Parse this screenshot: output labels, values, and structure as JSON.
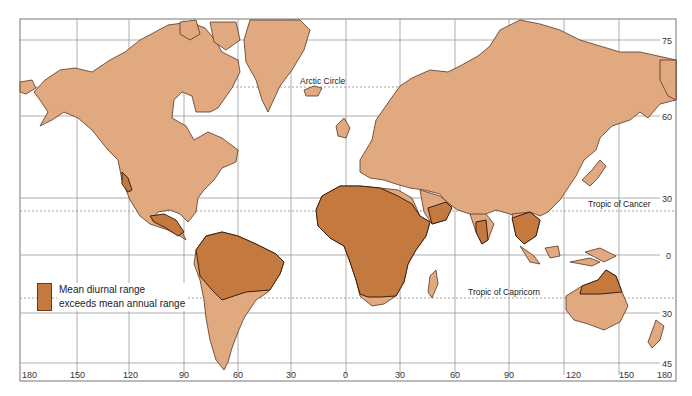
{
  "map": {
    "type": "world-mercator",
    "colors": {
      "land": "#e0a97f",
      "land_arid_region": "#d4a183",
      "highlight_region": "#c47a3e",
      "coastline": "#5a3520",
      "highlight_border": "#3a1f10",
      "grid": "#8a8a8a",
      "special_parallel": "#8a8a8a",
      "water": "#ffffff"
    },
    "longitude_labels": [
      "180",
      "150",
      "120",
      "90",
      "60",
      "30",
      "0",
      "30",
      "60",
      "90",
      "120",
      "150",
      "180"
    ],
    "latitude_labels": [
      "75",
      "60",
      "30",
      "0",
      "30",
      "45"
    ],
    "special_parallels": {
      "arctic_circle": "Arctic Circle",
      "tropic_of_cancer": "Tropic of Cancer",
      "tropic_of_capricorn": "Tropic of Capricorn"
    },
    "highlighted_regions": [
      "Northern South America / Amazon basin",
      "Sub-Saharan Africa (Sahel to southern Africa)",
      "Southern Arabian Peninsula",
      "Southern India",
      "Mainland Southeast Asia (Indochina)",
      "Northern Australia",
      "Central America / Southern Mexico",
      "Baja California coast"
    ]
  },
  "legend": {
    "line1": "Mean diurnal range",
    "line2": "exceeds mean annual range"
  }
}
